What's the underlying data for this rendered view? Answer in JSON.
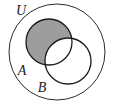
{
  "figure": {
    "type": "venn-diagram",
    "canvas": {
      "width": 115,
      "height": 104,
      "background": "#ffffff"
    },
    "shaded_region_meaning": "A \\ B",
    "colors": {
      "background": "#ffffff",
      "shading": "#9d9d9d",
      "stroke": "#1b1b1b",
      "universe_stroke": "#2a2a2a",
      "unshaded_fill": "#ffffff"
    }
  },
  "labels": {
    "universe": "U",
    "set_a": "A",
    "set_b": "B"
  },
  "shapes": {
    "universe": {
      "name": "U",
      "cx": 57,
      "cy": 52,
      "r": 48,
      "fill": "none",
      "stroke": "#2a2a2a",
      "stroke_width": 1
    },
    "circle_a": {
      "name": "A",
      "cx": 49,
      "cy": 42,
      "r": 23,
      "fill": "#9d9d9d",
      "stroke": "#1b1b1b",
      "stroke_width": 1.3,
      "shaded": true
    },
    "circle_b": {
      "name": "B",
      "cx": 68,
      "cy": 61,
      "r": 23,
      "fill": "#ffffff",
      "stroke": "#1b1b1b",
      "stroke_width": 1.3,
      "shaded": false
    }
  },
  "label_positions": {
    "universe": {
      "x": 21,
      "y": 15
    },
    "set_a": {
      "x": 22,
      "y": 75
    },
    "set_b": {
      "x": 42,
      "y": 92
    }
  }
}
